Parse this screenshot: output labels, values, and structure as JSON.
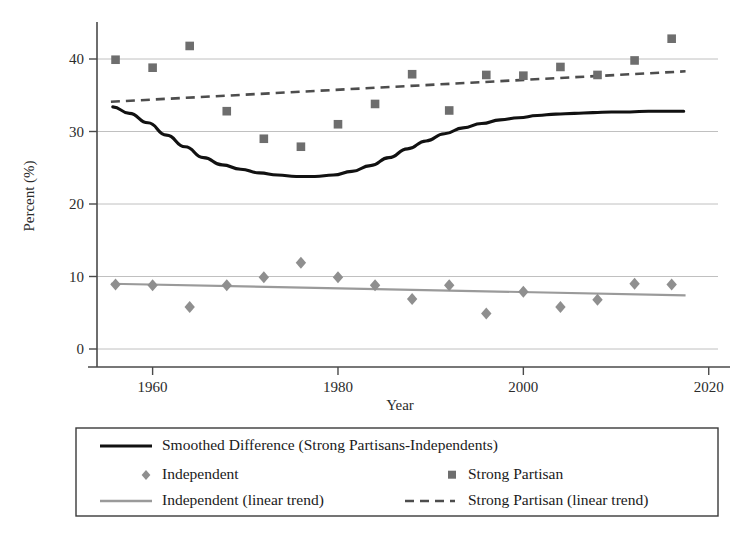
{
  "chart_data": {
    "type": "scatter",
    "title": "",
    "xlabel": "Year",
    "ylabel": "Percent (%)",
    "xlim": [
      1954,
      2021
    ],
    "ylim": [
      -1.5,
      44
    ],
    "xticks": [
      1960,
      1980,
      2000,
      2020
    ],
    "xtick_labels": [
      "1960",
      "1980",
      "2000",
      "2020"
    ],
    "yticks": [
      0,
      10,
      20,
      30,
      40
    ],
    "ytick_labels": [
      "0",
      "10",
      "20",
      "30",
      "40"
    ],
    "grid": "horizontal",
    "legend_position": "below-axes",
    "x": [
      1956,
      1960,
      1964,
      1968,
      1972,
      1976,
      1980,
      1984,
      1988,
      1992,
      1996,
      2000,
      2004,
      2008,
      2012,
      2016
    ],
    "series": [
      {
        "name": "Strong Partisan",
        "marker": "square",
        "color": "#6e6e6e",
        "values": [
          39.9,
          38.8,
          41.8,
          32.8,
          29.0,
          27.9,
          31.0,
          33.8,
          37.9,
          32.9,
          37.8,
          37.7,
          38.9,
          37.8,
          39.8,
          42.8
        ]
      },
      {
        "name": "Independent",
        "marker": "diamond",
        "color": "#8f8f8f",
        "values": [
          8.9,
          8.8,
          5.8,
          8.8,
          9.9,
          11.9,
          9.9,
          8.8,
          6.9,
          8.8,
          4.9,
          7.9,
          5.8,
          6.8,
          9.0,
          8.9
        ]
      },
      {
        "name": "Strong Partisan (linear trend)",
        "style": "dashed",
        "color": "#4d4d4d",
        "endpoints": [
          [
            1955.5,
            34.1
          ],
          [
            2017.5,
            38.3
          ]
        ]
      },
      {
        "name": "Independent (linear trend)",
        "style": "solid-gray",
        "color": "#9a9a9a",
        "endpoints": [
          [
            1955.5,
            9.0
          ],
          [
            2017.5,
            7.4
          ]
        ]
      },
      {
        "name": "Smoothed Difference (Strong Partisans-Independents)",
        "style": "solid-black",
        "color": "#111111",
        "smoothed": [
          [
            1955.7,
            33.4
          ],
          [
            1957.5,
            32.5
          ],
          [
            1959.5,
            31.2
          ],
          [
            1961.5,
            29.5
          ],
          [
            1963.5,
            27.9
          ],
          [
            1965.5,
            26.4
          ],
          [
            1967.5,
            25.4
          ],
          [
            1969.5,
            24.8
          ],
          [
            1971.5,
            24.3
          ],
          [
            1973.5,
            24.0
          ],
          [
            1975.5,
            23.8
          ],
          [
            1977.5,
            23.8
          ],
          [
            1979.5,
            24.0
          ],
          [
            1981.5,
            24.5
          ],
          [
            1983.5,
            25.3
          ],
          [
            1985.5,
            26.4
          ],
          [
            1987.5,
            27.6
          ],
          [
            1989.5,
            28.7
          ],
          [
            1991.5,
            29.7
          ],
          [
            1993.5,
            30.5
          ],
          [
            1995.5,
            31.1
          ],
          [
            1997.5,
            31.6
          ],
          [
            1999.5,
            31.9
          ],
          [
            2001.5,
            32.2
          ],
          [
            2003.5,
            32.4
          ],
          [
            2005.5,
            32.5
          ],
          [
            2007.5,
            32.6
          ],
          [
            2009.5,
            32.7
          ],
          [
            2011.5,
            32.7
          ],
          [
            2013.5,
            32.8
          ],
          [
            2015.5,
            32.8
          ],
          [
            2017.3,
            32.8
          ]
        ]
      }
    ]
  },
  "legend": {
    "entries": [
      {
        "label": "Smoothed Difference (Strong Partisans-Independents)",
        "key": "smoothed-difference",
        "symbol": "solid-black-line"
      },
      {
        "label": "Independent",
        "key": "independent",
        "symbol": "diamond-marker"
      },
      {
        "label": "Strong Partisan",
        "key": "strong-partisan",
        "symbol": "square-marker"
      },
      {
        "label": "Independent (linear trend)",
        "key": "independent-trend",
        "symbol": "solid-gray-line"
      },
      {
        "label": "Strong Partisan (linear trend)",
        "key": "strong-partisan-trend",
        "symbol": "dashed-line"
      }
    ]
  },
  "colors": {
    "strong_partisan": "#6e6e6e",
    "independent": "#8f8f8f",
    "smoothed_difference": "#111111",
    "independent_trend": "#9a9a9a",
    "strong_partisan_trend": "#4d4d4d",
    "grid": "#b9b9b9",
    "axis": "#4a4a4a",
    "background": "#ffffff"
  }
}
